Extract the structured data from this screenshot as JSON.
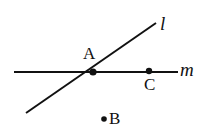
{
  "figure": {
    "kind": "geometry-diagram",
    "width": 207,
    "height": 133,
    "background_color": "#ffffff",
    "stroke_color": "#111111"
  },
  "lines": [
    {
      "id": "l",
      "label": "l",
      "style": "italic-serif",
      "x1": 26,
      "y1": 113,
      "x2": 156,
      "y2": 23,
      "thickness": 2,
      "label_x": 160,
      "label_y": 14
    },
    {
      "id": "m",
      "label": "m",
      "style": "italic-serif",
      "x1": 14,
      "y1": 72,
      "x2": 178,
      "y2": 72,
      "thickness": 2,
      "label_x": 180,
      "label_y": 60
    }
  ],
  "points": [
    {
      "id": "A",
      "label": "A",
      "x": 93,
      "y": 72,
      "radius": 3.6,
      "label_position": "above",
      "label_x": 83,
      "label_y": 45,
      "on_lines": [
        "l",
        "m"
      ],
      "note": "intersection of line l and line m"
    },
    {
      "id": "C",
      "label": "C",
      "x": 149,
      "y": 71,
      "radius": 3.2,
      "label_position": "below",
      "label_x": 144,
      "label_y": 76,
      "on_lines": [
        "m"
      ],
      "note": "point on line m"
    },
    {
      "id": "B",
      "label": "B",
      "x": 104,
      "y": 119,
      "radius": 2.8,
      "label_position": "right",
      "label_x": 109,
      "label_y": 110,
      "on_lines": [],
      "note": "isolated point below line m"
    }
  ]
}
